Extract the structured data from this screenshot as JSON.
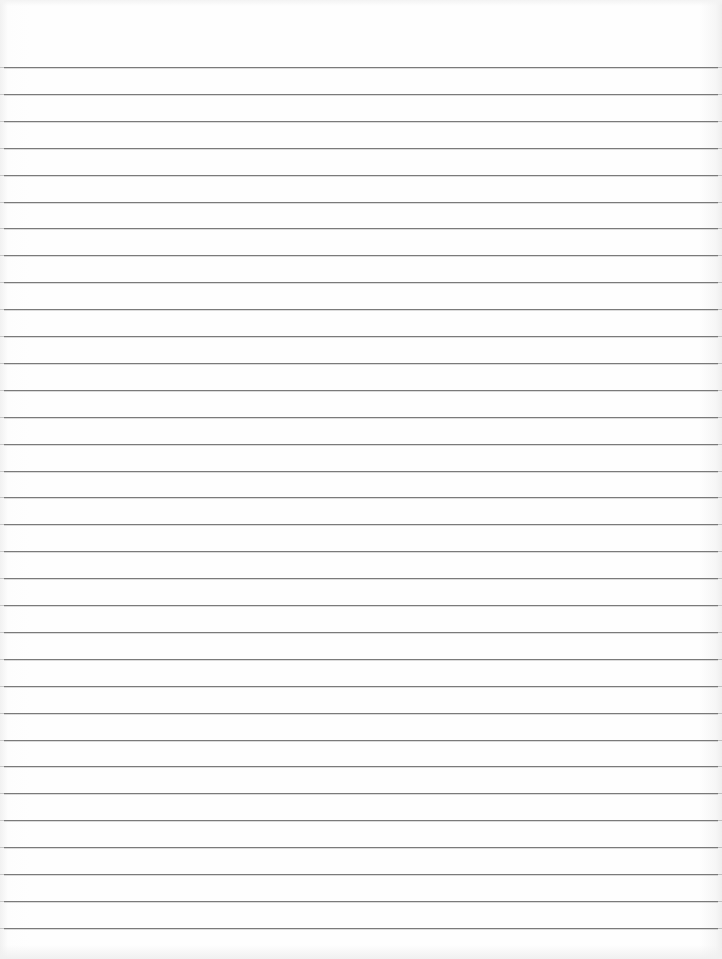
{
  "document": {
    "type": "lined-paper",
    "line_count": 33,
    "first_line_y": 67,
    "line_spacing": 26.9,
    "colors": {
      "paper": "#fefefe",
      "rule": "#7a7a7a"
    },
    "text_content": []
  }
}
